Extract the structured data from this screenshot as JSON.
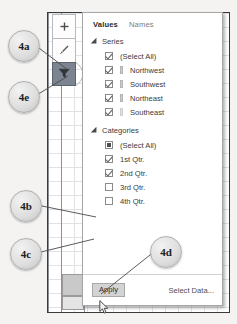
{
  "app": {
    "context": "excel-chart-filters-popup"
  },
  "chart_buttons": [
    {
      "name": "chart-elements-button",
      "icon": "plus-icon",
      "glyph": "+",
      "active": false
    },
    {
      "name": "chart-styles-button",
      "icon": "brush-icon",
      "glyph": "✎",
      "active": false
    },
    {
      "name": "chart-filters-button",
      "icon": "funnel-icon",
      "glyph": "▼",
      "active": true
    }
  ],
  "panel": {
    "tabs": [
      {
        "label": "Values",
        "active": true
      },
      {
        "label": "Names",
        "active": false
      }
    ],
    "series": {
      "header": "Series",
      "items": [
        {
          "label": "(Select All)",
          "state": "checked",
          "swatch": false
        },
        {
          "label": "Northwest",
          "state": "checked",
          "swatch": true
        },
        {
          "label": "Southwest",
          "state": "checked",
          "swatch": true
        },
        {
          "label": "Northeast",
          "state": "checked",
          "swatch": true
        },
        {
          "label": "Southeast",
          "state": "checked",
          "swatch": true
        }
      ]
    },
    "categories": {
      "header": "Categories",
      "items": [
        {
          "label": "(Select All)",
          "state": "indeterminate"
        },
        {
          "label": "1st Qtr.",
          "state": "checked"
        },
        {
          "label": "2nd Qtr.",
          "state": "checked"
        },
        {
          "label": "3rd Qtr.",
          "state": "unchecked"
        },
        {
          "label": "4th Qtr.",
          "state": "unchecked"
        }
      ]
    },
    "footer": {
      "apply_label": "Apply",
      "select_data_label": "Select Data..."
    }
  },
  "callouts": [
    {
      "label": "4a",
      "target": "chart-filters-button"
    },
    {
      "label": "4e",
      "target": "chart-filters-button"
    },
    {
      "label": "4b",
      "target": "category-3rd-qtr-checkbox"
    },
    {
      "label": "4c",
      "target": "category-4th-qtr-checkbox"
    },
    {
      "label": "4d",
      "target": "apply-button"
    }
  ],
  "colors": {
    "panel_border": "#a6a6a6",
    "active_button": "#7b8490",
    "grid_line": "#d6d9de",
    "apply_hover": "#d3d3d3"
  }
}
